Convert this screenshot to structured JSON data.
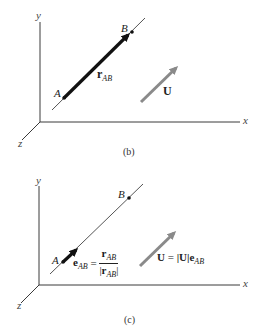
{
  "panels": [
    {
      "id": "b",
      "caption": "(b)",
      "axes": {
        "x": "x",
        "y": "y",
        "z": "z"
      },
      "points": {
        "A": "A",
        "B": "B"
      },
      "position_vector": {
        "symbol": "r",
        "subscript": "AB"
      },
      "vector_U": {
        "symbol": "U"
      }
    },
    {
      "id": "c",
      "caption": "(c)",
      "axes": {
        "x": "x",
        "y": "y",
        "z": "z"
      },
      "points": {
        "A": "A",
        "B": "B"
      },
      "unit_vector": {
        "symbol": "e",
        "subscript": "AB",
        "equals": "=",
        "numerator_symbol": "r",
        "numerator_subscript": "AB",
        "denominator_symbol": "r",
        "denominator_subscript": "AB",
        "abs_bar": "|"
      },
      "vector_U": {
        "symbol": "U",
        "equation_lhs": "U",
        "equals": "=",
        "magnitude": "|U|",
        "unit_symbol": "e",
        "unit_subscript": "AB"
      }
    }
  ],
  "colors": {
    "axis": "#3a3a3a",
    "position_vector": "#111111",
    "vector_U": "#8a8a8a",
    "background": "#ffffff"
  }
}
